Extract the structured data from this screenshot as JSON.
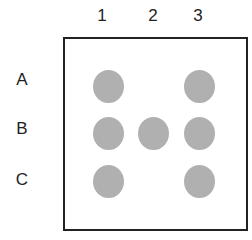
{
  "columns": [
    {
      "label": "1",
      "x": 108
    },
    {
      "label": "2",
      "x": 153
    },
    {
      "label": "3",
      "x": 198
    }
  ],
  "rows": [
    {
      "label": "A",
      "y": 85
    },
    {
      "label": "B",
      "y": 133
    },
    {
      "label": "C",
      "y": 181
    }
  ],
  "dot_color": "#b0b0b0",
  "dots": [
    {
      "row": "A",
      "col": "1"
    },
    {
      "row": "A",
      "col": "3"
    },
    {
      "row": "B",
      "col": "1"
    },
    {
      "row": "B",
      "col": "2"
    },
    {
      "row": "B",
      "col": "3"
    },
    {
      "row": "C",
      "col": "1"
    },
    {
      "row": "C",
      "col": "3"
    }
  ]
}
